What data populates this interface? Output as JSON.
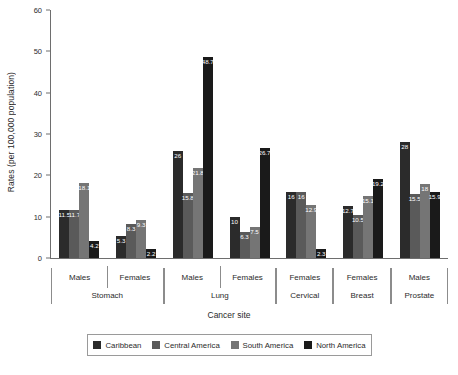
{
  "chart_data": {
    "type": "bar",
    "title": "",
    "xlabel": "Cancer site",
    "ylabel": "Rates (per 100,000 population)",
    "ylim": [
      0,
      60
    ],
    "yticks": [
      0,
      10,
      20,
      30,
      40,
      50,
      60
    ],
    "grid": false,
    "legend_position": "bottom",
    "categories": [
      "Stomach - Males",
      "Stomach - Females",
      "Lung - Males",
      "Lung - Females",
      "Cervical - Females",
      "Breast - Females",
      "Prostate - Males"
    ],
    "groups": [
      {
        "site": "Stomach",
        "sexes": [
          "Males",
          "Females"
        ]
      },
      {
        "site": "Lung",
        "sexes": [
          "Males",
          "Females"
        ]
      },
      {
        "site": "Cervical",
        "sexes": [
          "Females"
        ]
      },
      {
        "site": "Breast",
        "sexes": [
          "Females"
        ]
      },
      {
        "site": "Prostate",
        "sexes": [
          "Males"
        ]
      }
    ],
    "series": [
      {
        "name": "Caribbean",
        "color": "#2b2b2b",
        "values": [
          11.5,
          5.3,
          26,
          10,
          16,
          12.7,
          28
        ],
        "labels": [
          "11.5",
          "5.3",
          "26",
          "10",
          "16",
          "12.7",
          "28"
        ]
      },
      {
        "name": "Central America",
        "color": "#5a5a5a",
        "values": [
          11.7,
          8.3,
          15.8,
          6.3,
          16,
          10.5,
          15.5
        ],
        "labels": [
          "11.7",
          "8.3",
          "15.8",
          "6.3",
          "16",
          "10.5",
          "15.5"
        ]
      },
      {
        "name": "South America",
        "color": "#757575",
        "values": [
          18.1,
          9.3,
          21.8,
          7.5,
          12.9,
          15.1,
          18
        ],
        "labels": [
          "18.1",
          "9.3",
          "21.8",
          "7.5",
          "12.9",
          "15.1",
          "18"
        ]
      },
      {
        "name": "North America",
        "color": "#1a1a1a",
        "values": [
          4.2,
          2.2,
          48.7,
          26.7,
          2.3,
          19.2,
          15.9
        ],
        "labels": [
          "4.2",
          "2.2",
          "48.7",
          "26.7",
          "2.3",
          "19.2",
          "15.9"
        ]
      }
    ]
  }
}
